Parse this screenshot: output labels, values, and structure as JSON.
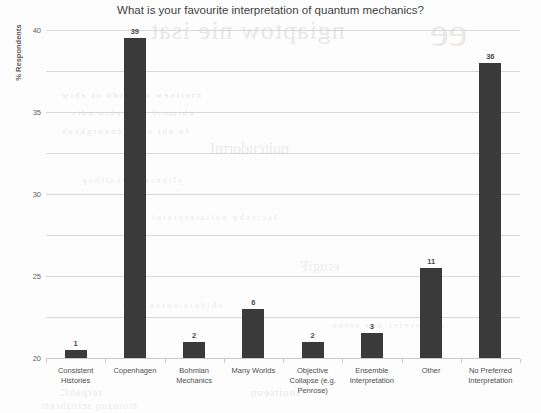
{
  "chart_data": {
    "type": "bar",
    "title": "What is your favourite interpretation of quantum mechanics?",
    "xlabel": "",
    "ylabel": "% Respondents",
    "ylim": [
      0,
      40
    ],
    "ytick_step": 5,
    "grid": true,
    "legend": "none",
    "bar_color": "#3a3a3a",
    "categories": [
      "Consistent Histories",
      "Copenhagen",
      "Bohmian Mechanics",
      "Many Worlds",
      "Objective Collapse (e.g. Penrose)",
      "Ensemble Interpretation",
      "Other",
      "No Preferred Interpretation"
    ],
    "category_lines": [
      [
        "Consistent",
        "Histories"
      ],
      [
        "Copenhagen"
      ],
      [
        "Bohmian",
        "Mechanics"
      ],
      [
        "Many Worlds"
      ],
      [
        "Objective",
        "Collapse (e.g.",
        "Penrose)"
      ],
      [
        "Ensemble",
        "Interpretation"
      ],
      [
        "Other"
      ],
      [
        "No Preferred",
        "Interpretation"
      ]
    ],
    "values": [
      1,
      39,
      2,
      6,
      2,
      3,
      11,
      36
    ],
    "value_labels": [
      "1",
      "39",
      "2",
      "6",
      "2",
      "3",
      "11",
      "36"
    ],
    "ytick_labels": [
      "0",
      "5",
      "10",
      "15",
      "20",
      "25",
      "30",
      "35",
      "40"
    ]
  },
  "artifact": {
    "description": "reverse-page scan bleed-through",
    "ghost_lines": [
      "ngiaptow nie isat",
      "ee",
      "nteitvew nsitatdn ot ehtw",
      "ehtmorf eht rehto edis",
      "fo eht egap dnuorgkcab",
      "yltnecer dehsilbup",
      "lacisyhp noitaterpretni",
      "noitcudortnI",
      "erugiF",
      "retpahC",
      "snoitseuq",
      "mutnauq scinahcem",
      "ehtdetaicossa htiw",
      "secnerefer dna seton"
    ]
  }
}
